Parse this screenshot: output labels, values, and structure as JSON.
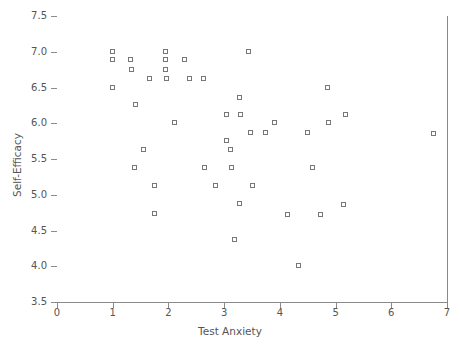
{
  "chart_data": {
    "type": "scatter",
    "title": "",
    "xlabel": "Test Anxiety",
    "ylabel": "Self-Efficacy",
    "xlim": [
      0,
      7
    ],
    "ylim": [
      3.5,
      7.5
    ],
    "xticks": [
      "0",
      "1",
      "2",
      "3",
      "4",
      "5",
      "6",
      "7"
    ],
    "xtick_values": [
      0,
      1,
      2,
      3,
      4,
      5,
      6,
      7
    ],
    "yticks": [
      "3.5",
      "4.0",
      "4.5",
      "5.0",
      "5.5",
      "6.0",
      "6.5",
      "7.0",
      "7.5"
    ],
    "ytick_values": [
      3.5,
      4.0,
      4.5,
      5.0,
      5.5,
      6.0,
      6.5,
      7.0,
      7.5
    ],
    "grid": false,
    "legend": null,
    "marker_style": "open-square",
    "marker_color": "#777777",
    "points": [
      {
        "x": 1.0,
        "y": 7.0
      },
      {
        "x": 1.0,
        "y": 6.88
      },
      {
        "x": 1.0,
        "y": 6.5
      },
      {
        "x": 1.32,
        "y": 6.88
      },
      {
        "x": 1.35,
        "y": 6.75
      },
      {
        "x": 1.42,
        "y": 6.25
      },
      {
        "x": 1.4,
        "y": 5.37
      },
      {
        "x": 1.56,
        "y": 5.62
      },
      {
        "x": 1.67,
        "y": 6.62
      },
      {
        "x": 1.75,
        "y": 5.12
      },
      {
        "x": 1.76,
        "y": 4.73
      },
      {
        "x": 1.96,
        "y": 7.0
      },
      {
        "x": 1.96,
        "y": 6.88
      },
      {
        "x": 1.96,
        "y": 6.75
      },
      {
        "x": 1.97,
        "y": 6.62
      },
      {
        "x": 2.12,
        "y": 6.0
      },
      {
        "x": 2.3,
        "y": 6.88
      },
      {
        "x": 2.39,
        "y": 6.62
      },
      {
        "x": 2.64,
        "y": 6.62
      },
      {
        "x": 2.66,
        "y": 5.37
      },
      {
        "x": 2.86,
        "y": 5.12
      },
      {
        "x": 3.05,
        "y": 6.12
      },
      {
        "x": 3.06,
        "y": 5.75
      },
      {
        "x": 3.12,
        "y": 5.62
      },
      {
        "x": 3.14,
        "y": 5.37
      },
      {
        "x": 3.2,
        "y": 4.37
      },
      {
        "x": 3.28,
        "y": 6.35
      },
      {
        "x": 3.3,
        "y": 6.12
      },
      {
        "x": 3.28,
        "y": 4.87
      },
      {
        "x": 3.44,
        "y": 7.0
      },
      {
        "x": 3.48,
        "y": 5.87
      },
      {
        "x": 3.52,
        "y": 5.12
      },
      {
        "x": 3.76,
        "y": 5.87
      },
      {
        "x": 3.92,
        "y": 6.0
      },
      {
        "x": 4.14,
        "y": 4.72
      },
      {
        "x": 4.35,
        "y": 4.0
      },
      {
        "x": 4.5,
        "y": 5.87
      },
      {
        "x": 4.6,
        "y": 5.37
      },
      {
        "x": 4.74,
        "y": 4.72
      },
      {
        "x": 4.86,
        "y": 6.5
      },
      {
        "x": 4.88,
        "y": 6.0
      },
      {
        "x": 5.15,
        "y": 4.86
      },
      {
        "x": 5.18,
        "y": 6.12
      },
      {
        "x": 6.77,
        "y": 5.85
      }
    ]
  }
}
